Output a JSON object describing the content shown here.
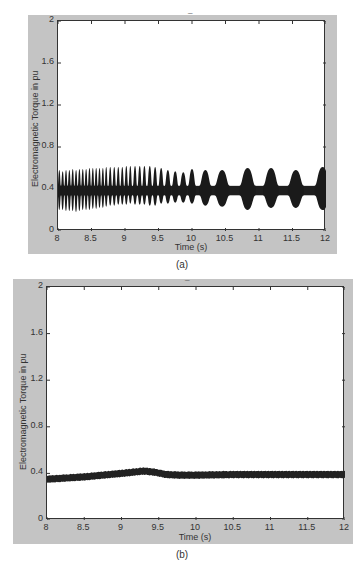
{
  "figure": {
    "panels": [
      {
        "id": "a",
        "caption": "(a)",
        "title_mark": "_"
      },
      {
        "id": "b",
        "caption": "(b)",
        "title_mark": "_"
      }
    ]
  },
  "chart_data": [
    {
      "type": "line",
      "panel": "(a)",
      "title": "",
      "xlabel": "Time (s)",
      "ylabel": "Electromagnetic Torque in pu",
      "xlim": [
        8,
        12
      ],
      "ylim": [
        0,
        2
      ],
      "xticks": [
        "8",
        "8.5",
        "9",
        "9.5",
        "10",
        "10.5",
        "11",
        "11.5",
        "12"
      ],
      "yticks": [
        "0",
        "0.4",
        "0.8",
        "1.2",
        "1.6",
        "2"
      ],
      "grid": false,
      "legend": null,
      "description": "Oscillating torque around ~0.38 pu; fast dense oscillations (about 0.22 to 0.58 pu) near t=8 s that progressively separate into distinct bursts with lower beat frequency; by 10-12 s bursts reach ~0.2 to ~0.6 pu with baseline band ~0.35-0.42 pu between them.",
      "series": [
        {
          "name": "Te",
          "mean": 0.38,
          "bursts_t": [
            8.02,
            8.07,
            8.12,
            8.17,
            8.22,
            8.27,
            8.32,
            8.37,
            8.42,
            8.47,
            8.52,
            8.57,
            8.62,
            8.67,
            8.72,
            8.78,
            8.84,
            8.9,
            8.96,
            9.02,
            9.08,
            9.15,
            9.22,
            9.29,
            9.37,
            9.45,
            9.54,
            9.64,
            9.75,
            9.87,
            10.0,
            10.2,
            10.45,
            10.83,
            11.18,
            11.55,
            11.95
          ],
          "bursts_max": [
            0.58,
            0.57,
            0.58,
            0.58,
            0.59,
            0.58,
            0.59,
            0.59,
            0.59,
            0.6,
            0.6,
            0.6,
            0.6,
            0.6,
            0.61,
            0.61,
            0.61,
            0.61,
            0.61,
            0.62,
            0.62,
            0.62,
            0.62,
            0.62,
            0.62,
            0.61,
            0.6,
            0.58,
            0.57,
            0.56,
            0.59,
            0.58,
            0.58,
            0.6,
            0.6,
            0.58,
            0.61
          ],
          "bursts_min": [
            0.2,
            0.2,
            0.19,
            0.19,
            0.19,
            0.18,
            0.19,
            0.2,
            0.2,
            0.2,
            0.21,
            0.21,
            0.22,
            0.22,
            0.23,
            0.24,
            0.24,
            0.25,
            0.25,
            0.25,
            0.26,
            0.25,
            0.25,
            0.25,
            0.24,
            0.24,
            0.26,
            0.26,
            0.27,
            0.27,
            0.26,
            0.24,
            0.23,
            0.2,
            0.22,
            0.22,
            0.2
          ],
          "baseline_band": [
            0.34,
            0.43
          ]
        }
      ]
    },
    {
      "type": "line",
      "panel": "(b)",
      "title": "",
      "xlabel": "Time (s)",
      "ylabel": "Electromagnetic Torque in pu",
      "xlim": [
        8,
        12
      ],
      "ylim": [
        0,
        2
      ],
      "xticks": [
        "8",
        "8.5",
        "9",
        "9.5",
        "10",
        "10.5",
        "11",
        "11.5",
        "12"
      ],
      "yticks": [
        "0",
        "0.4",
        "0.8",
        "1.2",
        "1.6",
        "2"
      ],
      "grid": false,
      "legend": null,
      "description": "Nearly constant torque with small ripple band (~0.05 pu thick); slow rise from ~0.35 pu at 8 s to peak ~0.42 pu near 9.3 s, then settling to ~0.39 pu from 9.7 s to 12 s.",
      "series": [
        {
          "name": "Te",
          "x": [
            8.0,
            8.25,
            8.5,
            8.75,
            9.0,
            9.15,
            9.3,
            9.45,
            9.6,
            9.8,
            10.0,
            10.5,
            11.0,
            11.5,
            12.0
          ],
          "y": [
            0.35,
            0.36,
            0.37,
            0.385,
            0.4,
            0.41,
            0.42,
            0.41,
            0.39,
            0.385,
            0.385,
            0.39,
            0.39,
            0.39,
            0.39
          ],
          "ripple_halfwidth": 0.028
        }
      ]
    }
  ]
}
